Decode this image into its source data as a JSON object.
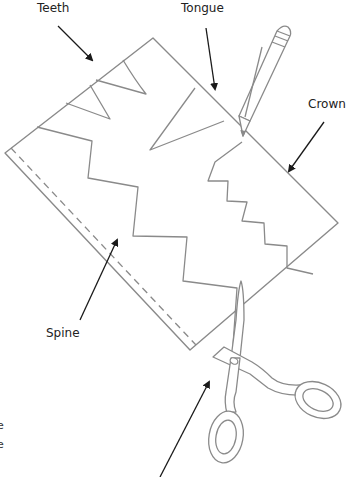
{
  "diagram": {
    "labels": {
      "teeth": "Teeth",
      "tongue": "Tongue",
      "crown": "Crown",
      "spine": "Spine"
    },
    "partial_text": [
      "e",
      "e"
    ],
    "colors": {
      "outline": "#8a8a8a",
      "arrow": "#1a1a1a",
      "text": "#222222",
      "background": "#ffffff"
    },
    "icons": [
      "pencil-icon",
      "scissors-icon"
    ]
  }
}
